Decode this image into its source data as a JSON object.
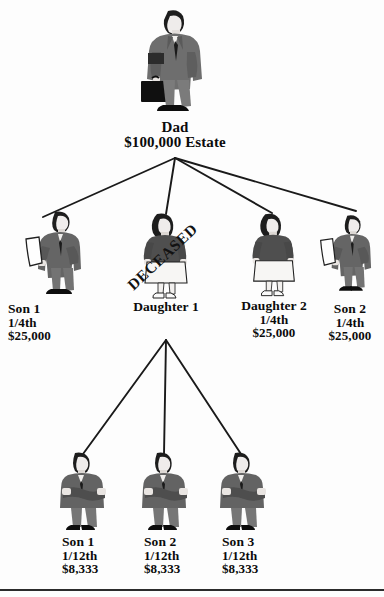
{
  "diagram": {
    "colors": {
      "background": "#fdfdfd",
      "ink": "#0b0b0b",
      "edge": "#1a1a1a",
      "suit_dark": "#4a4a4a",
      "suit_mid": "#6e6e6e",
      "suit_light": "#8d8d8d",
      "skin": "#f2f0ee",
      "hair": "#1d1d1d",
      "shoe": "#111111",
      "skirt": "#f6f5f3"
    },
    "stamp": {
      "text": "DECEASED",
      "rotation_deg": -43
    },
    "root": {
      "id": "dad",
      "icon": "businessman-with-briefcase-icon",
      "name": "Dad",
      "amount": "$100,000 Estate"
    },
    "generation_two": [
      {
        "id": "son-1",
        "icon": "man-reading-document-icon",
        "name": "Son 1",
        "share": "1/4th",
        "amount": "$25,000",
        "deceased": false,
        "align": "left"
      },
      {
        "id": "daughter-1",
        "icon": "woman-standing-icon",
        "name": "Daughter 1",
        "share": "",
        "amount": "",
        "deceased": true,
        "align": "center"
      },
      {
        "id": "daughter-2",
        "icon": "woman-standing-icon",
        "name": "Daughter 2",
        "share": "1/4th",
        "amount": "$25,000",
        "deceased": false,
        "align": "center"
      },
      {
        "id": "son-2",
        "icon": "man-reading-document-icon",
        "name": "Son 2",
        "share": "1/4th",
        "amount": "$25,000",
        "deceased": false,
        "align": "center"
      }
    ],
    "generation_three": [
      {
        "id": "grandson-1",
        "icon": "man-arms-crossed-icon",
        "name": "Son 1",
        "share": "1/12th",
        "amount": "$8,333"
      },
      {
        "id": "grandson-2",
        "icon": "man-arms-crossed-icon",
        "name": "Son 2",
        "share": "1/12th",
        "amount": "$8,333"
      },
      {
        "id": "grandson-3",
        "icon": "man-arms-crossed-icon",
        "name": "Son 3",
        "share": "1/12th",
        "amount": "$8,333"
      }
    ]
  }
}
